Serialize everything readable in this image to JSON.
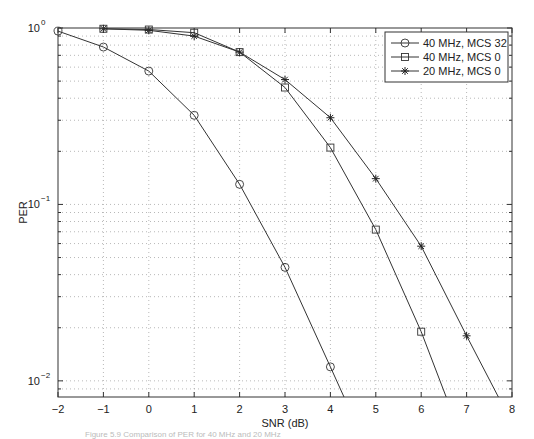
{
  "chart_data": {
    "type": "line",
    "title": "",
    "xlabel": "SNR (dB)",
    "ylabel": "PER",
    "xscale": "linear",
    "yscale": "log",
    "xlim": [
      -2,
      8
    ],
    "ylim": [
      0.0081,
      1
    ],
    "xticks": [
      -2,
      -1,
      0,
      1,
      2,
      3,
      4,
      5,
      6,
      7,
      8
    ],
    "xtick_labels": [
      "−2",
      "−1",
      "0",
      "1",
      "2",
      "3",
      "4",
      "5",
      "6",
      "7",
      "8"
    ],
    "yticks": [
      1,
      0.1,
      0.01
    ],
    "ytick_labels": [
      {
        "base": "10",
        "exp": "0"
      },
      {
        "base": "10",
        "exp": "−1"
      },
      {
        "base": "10",
        "exp": "−2"
      }
    ],
    "grid": true,
    "legend_position": "upper right",
    "series": [
      {
        "name": "40 MHz, MCS 32",
        "marker": "circle",
        "x": [
          -2,
          -1,
          0,
          1,
          2,
          3,
          4,
          4.3
        ],
        "values": [
          0.96,
          0.78,
          0.57,
          0.32,
          0.13,
          0.044,
          0.012,
          0.0081
        ],
        "marker_points": 7
      },
      {
        "name": "40 MHz, MCS 0",
        "marker": "square",
        "x": [
          -1,
          0,
          1,
          2,
          3,
          4,
          5,
          6,
          6.55
        ],
        "values": [
          0.99,
          0.98,
          0.94,
          0.73,
          0.46,
          0.21,
          0.072,
          0.019,
          0.0081
        ],
        "marker_points": 8
      },
      {
        "name": "20 MHz, MCS 0",
        "marker": "star",
        "x": [
          -1,
          0,
          1,
          2,
          3,
          4,
          5,
          6,
          7,
          7.7
        ],
        "values": [
          0.99,
          0.97,
          0.9,
          0.73,
          0.51,
          0.31,
          0.14,
          0.058,
          0.018,
          0.0081
        ],
        "marker_points": 9
      }
    ]
  },
  "caption": "Figure 5.9  Comparison of PER for 40 MHz and 20 MHz"
}
